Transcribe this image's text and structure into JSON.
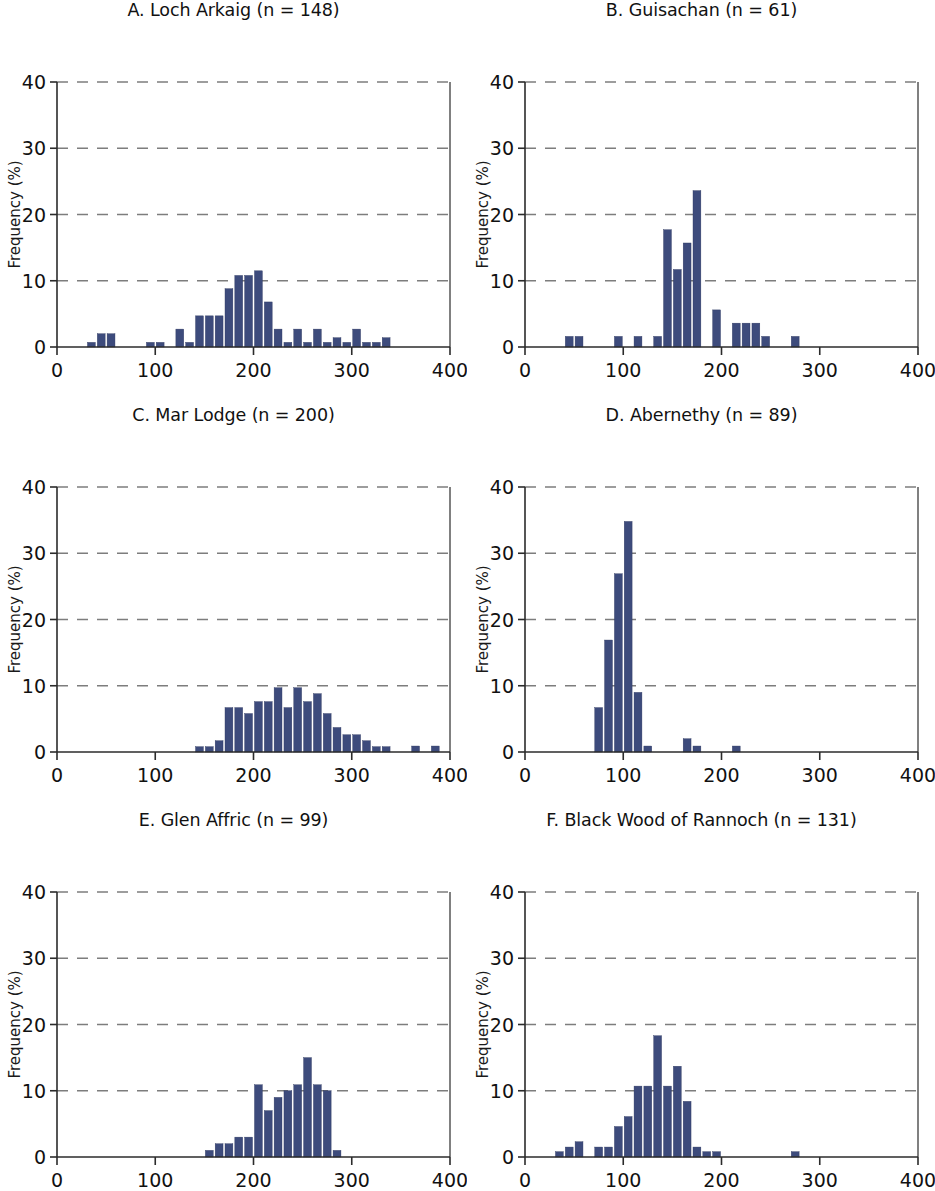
{
  "figure": {
    "background": "#ffffff",
    "bar_color": "#3d4b7c",
    "grid_color": "#7d7d7d",
    "axis_color": "#2b2b2b",
    "panel_count": 6
  },
  "axis_common": {
    "xlabel": "Age in 10-year classes",
    "ylabel": "Frequency (%)",
    "xlim": [
      0,
      400
    ],
    "ylim": [
      0,
      40
    ],
    "xticks": [
      0,
      100,
      200,
      300,
      400
    ],
    "xtick_labels": [
      "0",
      "100",
      "200",
      "300",
      "400"
    ],
    "yticks": [
      0,
      10,
      20,
      30,
      40
    ],
    "ytick_labels": [
      "0",
      "10",
      "20",
      "30",
      "40"
    ],
    "grid": "horizontal-dashed",
    "bin_width": 10
  },
  "chart_data": [
    {
      "type": "bar",
      "panel": "A",
      "title": "A. Loch Arkaig (n = 148)",
      "site": "Loch Arkaig",
      "n": 148,
      "xlabel": "Age in 10-year classes",
      "ylabel": "Frequency (%)",
      "xlim": [
        0,
        400
      ],
      "ylim": [
        0,
        40
      ],
      "xticks": [
        0,
        100,
        200,
        300,
        400
      ],
      "yticks": [
        0,
        10,
        20,
        30,
        40
      ],
      "grid": true,
      "bin_width": 10,
      "x": [
        30,
        40,
        50,
        90,
        100,
        120,
        130,
        140,
        150,
        160,
        170,
        180,
        190,
        200,
        210,
        220,
        230,
        240,
        250,
        260,
        270,
        280,
        290,
        300,
        310,
        320,
        330
      ],
      "values": [
        0.7,
        2.0,
        2.0,
        0.7,
        0.7,
        2.7,
        0.7,
        4.7,
        4.7,
        4.7,
        8.8,
        10.8,
        10.8,
        11.5,
        6.8,
        2.7,
        0.7,
        2.7,
        0.7,
        2.7,
        0.7,
        1.4,
        0.7,
        2.7,
        0.7,
        0.7,
        1.4
      ]
    },
    {
      "type": "bar",
      "panel": "B",
      "title": "B. Guisachan (n = 61)",
      "site": "Guisachan",
      "n": 61,
      "xlabel": "Age in 10-year classes",
      "ylabel": "Frequency (%)",
      "xlim": [
        0,
        400
      ],
      "ylim": [
        0,
        40
      ],
      "xticks": [
        0,
        100,
        200,
        300,
        400
      ],
      "yticks": [
        0,
        10,
        20,
        30,
        40
      ],
      "grid": true,
      "bin_width": 10,
      "x": [
        40,
        50,
        90,
        110,
        130,
        140,
        150,
        160,
        170,
        190,
        210,
        220,
        230,
        240,
        270
      ],
      "values": [
        1.6,
        1.6,
        1.6,
        1.6,
        1.6,
        17.7,
        11.7,
        15.7,
        23.6,
        5.6,
        3.6,
        3.6,
        3.6,
        1.6,
        1.6
      ]
    },
    {
      "type": "bar",
      "panel": "C",
      "title": "C. Mar Lodge (n = 200)",
      "site": "Mar Lodge",
      "n": 200,
      "xlabel": "Age in 10-year classes",
      "ylabel": "Frequency (%)",
      "xlim": [
        0,
        400
      ],
      "ylim": [
        0,
        40
      ],
      "xticks": [
        0,
        100,
        200,
        300,
        400
      ],
      "yticks": [
        0,
        10,
        20,
        30,
        40
      ],
      "grid": true,
      "bin_width": 10,
      "x": [
        140,
        150,
        160,
        170,
        180,
        190,
        200,
        210,
        220,
        230,
        240,
        250,
        260,
        270,
        280,
        290,
        300,
        310,
        320,
        330,
        360,
        380
      ],
      "values": [
        0.8,
        0.8,
        1.7,
        6.7,
        6.7,
        5.8,
        7.6,
        7.6,
        9.7,
        6.7,
        9.7,
        7.6,
        8.8,
        5.8,
        3.7,
        2.6,
        2.6,
        1.7,
        0.8,
        0.8,
        0.9,
        0.9
      ]
    },
    {
      "type": "bar",
      "panel": "D",
      "title": "D. Abernethy (n = 89)",
      "site": "Abernethy",
      "n": 89,
      "xlabel": "Age in 10-year classes",
      "ylabel": "Frequency (%)",
      "xlim": [
        0,
        400
      ],
      "ylim": [
        0,
        40
      ],
      "xticks": [
        0,
        100,
        200,
        300,
        400
      ],
      "yticks": [
        0,
        10,
        20,
        30,
        40
      ],
      "grid": true,
      "bin_width": 10,
      "x": [
        70,
        80,
        90,
        100,
        110,
        120,
        160,
        170,
        210
      ],
      "values": [
        6.7,
        16.9,
        26.9,
        34.8,
        9.0,
        0.9,
        2.0,
        0.9,
        0.9
      ]
    },
    {
      "type": "bar",
      "panel": "E",
      "title": "E. Glen Affric (n = 99)",
      "site": "Glen Affric",
      "n": 99,
      "xlabel": "Age in 10-year classes",
      "ylabel": "Frequency (%)",
      "xlim": [
        0,
        400
      ],
      "ylim": [
        0,
        40
      ],
      "xticks": [
        0,
        100,
        200,
        300,
        400
      ],
      "yticks": [
        0,
        10,
        20,
        30,
        40
      ],
      "grid": true,
      "bin_width": 10,
      "x": [
        150,
        160,
        170,
        180,
        190,
        200,
        210,
        220,
        230,
        240,
        250,
        260,
        270,
        280
      ],
      "values": [
        1.0,
        2.0,
        2.0,
        3.0,
        3.0,
        10.9,
        7.0,
        9.0,
        10.0,
        10.9,
        15.0,
        10.9,
        10.0,
        1.0
      ]
    },
    {
      "type": "bar",
      "panel": "F",
      "title": "F. Black Wood of Rannoch (n = 131)",
      "site": "Black Wood of Rannoch",
      "n": 131,
      "xlabel": "Age in 10-year classes",
      "ylabel": "Frequency (%)",
      "xlim": [
        0,
        400
      ],
      "ylim": [
        0,
        40
      ],
      "xticks": [
        0,
        100,
        200,
        300,
        400
      ],
      "yticks": [
        0,
        10,
        20,
        30,
        40
      ],
      "grid": true,
      "bin_width": 10,
      "x": [
        30,
        40,
        50,
        70,
        80,
        90,
        100,
        110,
        120,
        130,
        140,
        150,
        160,
        170,
        180,
        190,
        270
      ],
      "values": [
        0.8,
        1.5,
        2.3,
        1.5,
        1.5,
        4.6,
        6.1,
        10.7,
        10.7,
        18.3,
        10.7,
        13.7,
        8.4,
        1.5,
        0.8,
        0.8,
        0.8
      ]
    }
  ]
}
